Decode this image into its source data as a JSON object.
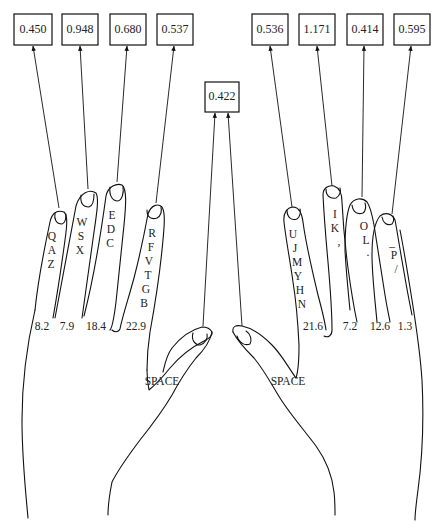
{
  "diagram": {
    "type": "finger-load-diagram",
    "colors": {
      "line": "#111111",
      "text": "#222222",
      "background": "#ffffff"
    },
    "left_hand": {
      "fingers": [
        {
          "name": "left-pinky",
          "box_value": "0.450",
          "keys": [
            "Q",
            "A",
            "Z"
          ],
          "percent": "8.2"
        },
        {
          "name": "left-ring",
          "box_value": "0.948",
          "keys": [
            "W",
            "S",
            "X"
          ],
          "percent": "7.9"
        },
        {
          "name": "left-middle",
          "box_value": "0.680",
          "keys": [
            "E",
            "D",
            "C"
          ],
          "percent": "18.4"
        },
        {
          "name": "left-index",
          "box_value": "0.537",
          "keys": [
            "R",
            "F",
            "V",
            "T",
            "G",
            "B"
          ],
          "percent": "22.9"
        }
      ],
      "thumb_label": "SPACE"
    },
    "right_hand": {
      "fingers": [
        {
          "name": "right-index",
          "box_value": "0.536",
          "keys": [
            "U",
            "J",
            "M",
            "Y",
            "H",
            "N"
          ],
          "percent": "21.6"
        },
        {
          "name": "right-middle",
          "box_value": "1.171",
          "keys": [
            "I",
            "K",
            ","
          ],
          "percent": "7.2"
        },
        {
          "name": "right-ring",
          "box_value": "0.414",
          "keys": [
            "O",
            "L",
            "."
          ],
          "percent": "12.6"
        },
        {
          "name": "right-pinky",
          "box_value": "0.595",
          "keys": [
            "_",
            "P",
            "/"
          ],
          "percent": "1.3"
        }
      ],
      "thumb_label": "SPACE"
    },
    "thumbs_box_value": "0.422"
  }
}
